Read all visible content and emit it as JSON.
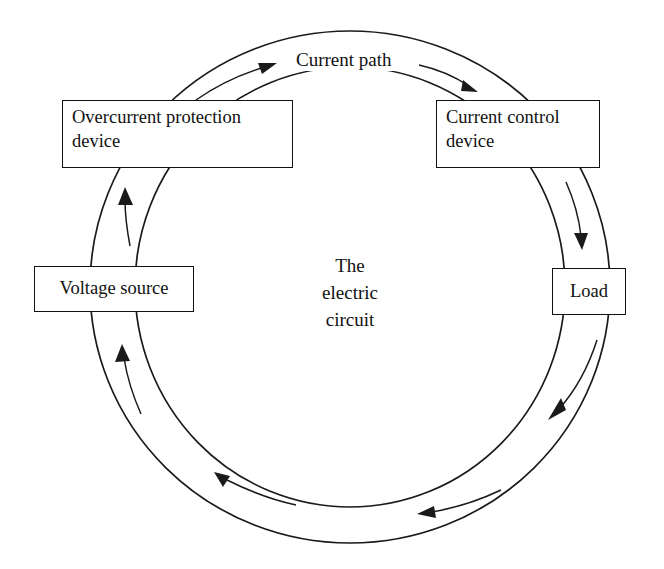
{
  "diagram": {
    "title_label": "The\nelectric\ncircuit",
    "path_label": "Current path",
    "colors": {
      "stroke": "#1a1a1a",
      "background": "#ffffff",
      "text": "#111111"
    },
    "nodes": [
      {
        "id": "overcurrent-protection-device",
        "label": "Overcurrent protection\ndevice"
      },
      {
        "id": "current-control-device",
        "label": "Current control\ndevice"
      },
      {
        "id": "load",
        "label": "Load"
      },
      {
        "id": "voltage-source",
        "label": "Voltage source"
      }
    ],
    "flow": {
      "direction": "clockwise",
      "arrow_count": 7,
      "sequence": [
        "voltage-source",
        "overcurrent-protection-device",
        "current-control-device",
        "load",
        "voltage-source"
      ]
    }
  }
}
